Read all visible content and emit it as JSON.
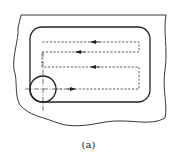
{
  "figure": {
    "caption": "(a)",
    "colors": {
      "line": "#222222",
      "background": "#ffffff"
    },
    "elements": {
      "workpiece_boundary": "irregular break-line outline",
      "pocket_contour": "rounded rectangle",
      "toolpath": "dashed zigzag passes with direction arrows",
      "cutter": "circle with dash-dot centerlines"
    },
    "passes": [
      {
        "y": 89,
        "direction": "right"
      },
      {
        "y": 67,
        "direction": "left"
      },
      {
        "y": 52,
        "direction": "left"
      },
      {
        "y": 42,
        "direction": "left"
      }
    ]
  }
}
